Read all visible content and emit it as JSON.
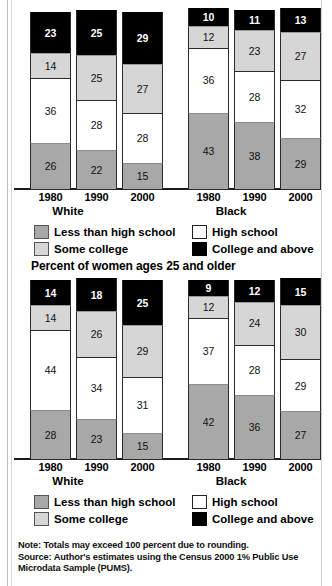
{
  "page": {
    "note_lines": [
      "Note: Totals may exceed 100 percent due to rounding.",
      "Source: Author's estimates using the Census 2000 1% Public Use",
      "Microdata Sample (PUMS)."
    ]
  },
  "legend": {
    "items": [
      {
        "key": "s-lths",
        "label": "Less than high school"
      },
      {
        "key": "s-hs",
        "label": "High school"
      },
      {
        "key": "s-some",
        "label": "Some college"
      },
      {
        "key": "s-coll",
        "label": "College and above"
      }
    ]
  },
  "colors": {
    "less_than_high_school": "#a8a8a8",
    "high_school": "#ffffff",
    "some_college": "#d6d6d6",
    "college_and_above": "#000000",
    "axis": "#1b1b1b"
  },
  "charts": {
    "men": {
      "title": "",
      "group_labels": [
        "White",
        "Black"
      ],
      "x_labels": [
        "1980",
        "1990",
        "2000",
        "1980",
        "1990",
        "2000"
      ]
    },
    "women": {
      "title": "Percent of women ages 25 and older",
      "group_labels": [
        "White",
        "Black"
      ],
      "x_labels": [
        "1980",
        "1990",
        "2000",
        "1980",
        "1990",
        "2000"
      ]
    }
  },
  "chart_data": [
    {
      "type": "bar",
      "subtype": "stacked-vertical",
      "title": "",
      "xlabel": "",
      "ylabel": "Percent",
      "ylim": [
        0,
        100
      ],
      "grid": false,
      "legend_position": "below-axis",
      "groups": [
        "White",
        "Black"
      ],
      "categories": [
        "1980",
        "1990",
        "2000",
        "1980",
        "1990",
        "2000"
      ],
      "series": [
        {
          "name": "Less than high school",
          "values": [
            26,
            22,
            15,
            43,
            38,
            29
          ]
        },
        {
          "name": "High school",
          "values": [
            36,
            28,
            28,
            36,
            28,
            32
          ]
        },
        {
          "name": "Some college",
          "values": [
            14,
            25,
            27,
            12,
            23,
            27
          ]
        },
        {
          "name": "College and above",
          "values": [
            23,
            25,
            29,
            10,
            11,
            13
          ]
        }
      ]
    },
    {
      "type": "bar",
      "subtype": "stacked-vertical",
      "title": "Percent of women ages 25 and older",
      "xlabel": "",
      "ylabel": "Percent",
      "ylim": [
        0,
        100
      ],
      "grid": false,
      "legend_position": "below-axis",
      "groups": [
        "White",
        "Black"
      ],
      "categories": [
        "1980",
        "1990",
        "2000",
        "1980",
        "1990",
        "2000"
      ],
      "series": [
        {
          "name": "Less than high school",
          "values": [
            28,
            23,
            15,
            42,
            36,
            27
          ]
        },
        {
          "name": "High school",
          "values": [
            44,
            34,
            31,
            37,
            28,
            29
          ]
        },
        {
          "name": "Some college",
          "values": [
            14,
            26,
            29,
            12,
            24,
            30
          ]
        },
        {
          "name": "College and above",
          "values": [
            14,
            18,
            25,
            9,
            12,
            15
          ]
        }
      ]
    }
  ]
}
